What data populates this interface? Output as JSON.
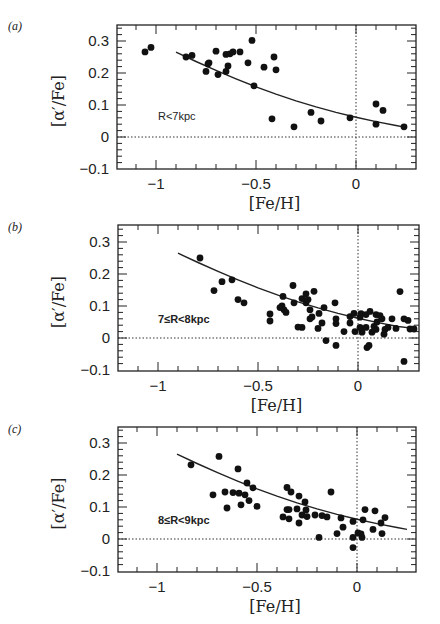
{
  "chart_data": [
    {
      "type": "scatter",
      "panel_label": "(a)",
      "annotation": "R<7kpc",
      "xlabel": "[Fe/H]",
      "ylabel": "[α′/Fe]",
      "xlim": [
        -1.2,
        0.3
      ],
      "ylim": [
        -0.1,
        0.35
      ],
      "xticks": [
        -1,
        -0.5,
        0
      ],
      "xtick_labels": [
        "−1",
        "−0.5",
        "0"
      ],
      "yticks": [
        -0.1,
        0,
        0.1,
        0.2,
        0.3
      ],
      "ytick_labels": [
        "−0.1",
        "0",
        "0.1",
        "0.2",
        "0.3"
      ],
      "reference_lines": {
        "horizontal": 0,
        "vertical": 0
      },
      "grid": false,
      "legend": null,
      "series": [
        {
          "name": "stars",
          "points": [
            [
              -1.055,
              0.266
            ],
            [
              -1.025,
              0.28
            ],
            [
              -0.85,
              0.25
            ],
            [
              -0.82,
              0.255
            ],
            [
              -0.75,
              0.205
            ],
            [
              -0.74,
              0.228
            ],
            [
              -0.735,
              0.232
            ],
            [
              -0.7,
              0.268
            ],
            [
              -0.69,
              0.195
            ],
            [
              -0.65,
              0.205
            ],
            [
              -0.65,
              0.258
            ],
            [
              -0.64,
              0.222
            ],
            [
              -0.63,
              0.26
            ],
            [
              -0.615,
              0.266
            ],
            [
              -0.58,
              0.266
            ],
            [
              -0.54,
              0.232
            ],
            [
              -0.52,
              0.302
            ],
            [
              -0.51,
              0.16
            ],
            [
              -0.46,
              0.218
            ],
            [
              -0.42,
              0.057
            ],
            [
              -0.41,
              0.25
            ],
            [
              -0.4,
              0.21
            ],
            [
              -0.31,
              0.032
            ],
            [
              -0.225,
              0.077
            ],
            [
              -0.175,
              0.05
            ],
            [
              -0.03,
              0.06
            ],
            [
              0.1,
              0.103
            ],
            [
              0.135,
              0.083
            ],
            [
              0.1,
              0.04
            ],
            [
              0.24,
              0.032
            ]
          ]
        },
        {
          "name": "fit",
          "line": [
            [
              -0.9,
              0.265
            ],
            [
              -0.8,
              0.236
            ],
            [
              -0.7,
              0.208
            ],
            [
              -0.6,
              0.182
            ],
            [
              -0.5,
              0.157
            ],
            [
              -0.4,
              0.134
            ],
            [
              -0.3,
              0.113
            ],
            [
              -0.2,
              0.094
            ],
            [
              -0.1,
              0.077
            ],
            [
              0.0,
              0.062
            ],
            [
              0.1,
              0.048
            ],
            [
              0.2,
              0.036
            ],
            [
              0.25,
              0.03
            ]
          ]
        }
      ]
    },
    {
      "type": "scatter",
      "panel_label": "(b)",
      "annotation": "7≤R<8kpc",
      "xlabel": "[Fe/H]",
      "ylabel": "[α′/Fe]",
      "xlim": [
        -1.2,
        0.3
      ],
      "ylim": [
        -0.1,
        0.35
      ],
      "xticks": [
        -1,
        -0.5,
        0
      ],
      "xtick_labels": [
        "−1",
        "−0.5",
        "0"
      ],
      "yticks": [
        -0.1,
        0,
        0.1,
        0.2,
        0.3
      ],
      "ytick_labels": [
        "−0.1",
        "0",
        "0.1",
        "0.2",
        "0.3"
      ],
      "reference_lines": {
        "horizontal": 0,
        "vertical": 0
      },
      "grid": false,
      "legend": null,
      "series": [
        {
          "name": "stars",
          "points": [
            [
              -0.79,
              0.25
            ],
            [
              -0.72,
              0.148
            ],
            [
              -0.68,
              0.176
            ],
            [
              -0.63,
              0.182
            ],
            [
              -0.6,
              0.12
            ],
            [
              -0.57,
              0.11
            ],
            [
              -0.44,
              0.075
            ],
            [
              -0.44,
              0.053
            ],
            [
              -0.39,
              0.095
            ],
            [
              -0.38,
              0.1
            ],
            [
              -0.375,
              0.13
            ],
            [
              -0.37,
              0.088
            ],
            [
              -0.36,
              0.08
            ],
            [
              -0.325,
              0.164
            ],
            [
              -0.32,
              0.11
            ],
            [
              -0.3,
              0.034
            ],
            [
              -0.28,
              0.033
            ],
            [
              -0.28,
              0.123
            ],
            [
              -0.26,
              0.138
            ],
            [
              -0.26,
              0.11
            ],
            [
              -0.25,
              0.12
            ],
            [
              -0.24,
              0.088
            ],
            [
              -0.24,
              0.06
            ],
            [
              -0.23,
              0.066
            ],
            [
              -0.22,
              0.146
            ],
            [
              -0.195,
              0.077
            ],
            [
              -0.2,
              0.03
            ],
            [
              -0.18,
              0.047
            ],
            [
              -0.17,
              0.095
            ],
            [
              -0.16,
              -0.008
            ],
            [
              -0.115,
              0.11
            ],
            [
              -0.11,
              0.06
            ],
            [
              -0.11,
              0.045
            ],
            [
              -0.11,
              -0.023
            ],
            [
              -0.07,
              0.02
            ],
            [
              -0.04,
              0.047
            ],
            [
              -0.04,
              0.067
            ],
            [
              -0.02,
              0.077
            ],
            [
              -0.015,
              0.02
            ],
            [
              0.01,
              0.065
            ],
            [
              0.01,
              0.033
            ],
            [
              0.015,
              0.076
            ],
            [
              0.02,
              0.018
            ],
            [
              0.04,
              0.073
            ],
            [
              0.04,
              0.033
            ],
            [
              0.045,
              -0.03
            ],
            [
              0.055,
              -0.023
            ],
            [
              0.06,
              0.083
            ],
            [
              0.07,
              0.018
            ],
            [
              0.08,
              0.036
            ],
            [
              0.09,
              0.027
            ],
            [
              0.09,
              0.073
            ],
            [
              0.095,
              0.05
            ],
            [
              0.11,
              0.07
            ],
            [
              0.12,
              0.06
            ],
            [
              0.13,
              0.012
            ],
            [
              0.135,
              0.027
            ],
            [
              0.15,
              0.033
            ],
            [
              0.17,
              0.06
            ],
            [
              0.19,
              0.03
            ],
            [
              0.21,
              0.145
            ],
            [
              0.23,
              0.06
            ],
            [
              0.23,
              -0.073
            ],
            [
              0.25,
              0.055
            ],
            [
              0.26,
              0.028
            ],
            [
              0.28,
              0.028
            ]
          ]
        },
        {
          "name": "fit",
          "line": [
            [
              -0.9,
              0.265
            ],
            [
              -0.8,
              0.236
            ],
            [
              -0.7,
              0.208
            ],
            [
              -0.6,
              0.182
            ],
            [
              -0.5,
              0.157
            ],
            [
              -0.4,
              0.134
            ],
            [
              -0.3,
              0.113
            ],
            [
              -0.2,
              0.094
            ],
            [
              -0.1,
              0.077
            ],
            [
              0.0,
              0.062
            ],
            [
              0.1,
              0.048
            ],
            [
              0.2,
              0.036
            ],
            [
              0.28,
              0.03
            ]
          ]
        }
      ]
    },
    {
      "type": "scatter",
      "panel_label": "(c)",
      "annotation": "8≤R<9kpc",
      "xlabel": "[Fe/H]",
      "ylabel": "[α′/Fe]",
      "xlim": [
        -1.2,
        0.3
      ],
      "ylim": [
        -0.1,
        0.35
      ],
      "xticks": [
        -1,
        -0.5,
        0
      ],
      "xtick_labels": [
        "−1",
        "−0.5",
        "0"
      ],
      "yticks": [
        -0.1,
        0,
        0.1,
        0.2,
        0.3
      ],
      "ytick_labels": [
        "−0.1",
        "0",
        "0.1",
        "0.2",
        "0.3"
      ],
      "reference_lines": {
        "horizontal": 0,
        "vertical": 0
      },
      "grid": false,
      "legend": null,
      "series": [
        {
          "name": "stars",
          "points": [
            [
              -0.83,
              0.232
            ],
            [
              -0.72,
              0.138
            ],
            [
              -0.69,
              0.258
            ],
            [
              -0.66,
              0.147
            ],
            [
              -0.65,
              0.097
            ],
            [
              -0.62,
              0.145
            ],
            [
              -0.595,
              0.219
            ],
            [
              -0.59,
              0.143
            ],
            [
              -0.58,
              0.107
            ],
            [
              -0.56,
              0.138
            ],
            [
              -0.55,
              0.175
            ],
            [
              -0.54,
              0.12
            ],
            [
              -0.52,
              0.16
            ],
            [
              -0.5,
              0.102
            ],
            [
              -0.37,
              0.069
            ],
            [
              -0.35,
              0.161
            ],
            [
              -0.35,
              0.092
            ],
            [
              -0.34,
              0.092
            ],
            [
              -0.34,
              0.063
            ],
            [
              -0.33,
              0.147
            ],
            [
              -0.3,
              0.094
            ],
            [
              -0.29,
              0.134
            ],
            [
              -0.29,
              0.05
            ],
            [
              -0.275,
              0.075
            ],
            [
              -0.26,
              0.116
            ],
            [
              -0.255,
              0.091
            ],
            [
              -0.25,
              0.07
            ],
            [
              -0.21,
              0.075
            ],
            [
              -0.19,
              0.005
            ],
            [
              -0.175,
              0.073
            ],
            [
              -0.15,
              0.069
            ],
            [
              -0.13,
              0.147
            ],
            [
              -0.1,
              0.017
            ],
            [
              -0.08,
              0.066
            ],
            [
              -0.07,
              0.037
            ],
            [
              -0.02,
              0.055
            ],
            [
              -0.02,
              0.005
            ],
            [
              -0.02,
              -0.027
            ],
            [
              0.005,
              0.019
            ],
            [
              0.02,
              0.016
            ],
            [
              0.025,
              0.005
            ],
            [
              0.03,
              0.06
            ],
            [
              0.04,
              0.092
            ],
            [
              0.08,
              0.03
            ],
            [
              0.09,
              0.088
            ],
            [
              0.12,
              0.05
            ],
            [
              0.125,
              0.017
            ],
            [
              0.14,
              0.067
            ]
          ]
        },
        {
          "name": "fit",
          "line": [
            [
              -0.9,
              0.265
            ],
            [
              -0.8,
              0.236
            ],
            [
              -0.7,
              0.208
            ],
            [
              -0.6,
              0.182
            ],
            [
              -0.5,
              0.157
            ],
            [
              -0.4,
              0.134
            ],
            [
              -0.3,
              0.113
            ],
            [
              -0.2,
              0.094
            ],
            [
              -0.1,
              0.077
            ],
            [
              0.0,
              0.062
            ],
            [
              0.1,
              0.048
            ],
            [
              0.2,
              0.036
            ],
            [
              0.25,
              0.03
            ]
          ]
        }
      ]
    }
  ],
  "layout": {
    "panels": [
      {
        "frame": [
          117,
          25,
          416,
          169
        ],
        "x0px": 356,
        "y0px": 137,
        "label_pos": [
          8,
          30
        ],
        "annot_pos": [
          158,
          120
        ],
        "annot_bold": false
      },
      {
        "frame": [
          118,
          225,
          419,
          371
        ],
        "x0px": 358,
        "y0px": 338,
        "label_pos": [
          8,
          231
        ],
        "annot_pos": [
          158,
          323
        ],
        "annot_bold": true
      },
      {
        "frame": [
          118,
          427,
          416,
          572
        ],
        "x0px": 357,
        "y0px": 539,
        "label_pos": [
          8,
          433
        ],
        "annot_pos": [
          158,
          524
        ],
        "annot_bold": true
      }
    ],
    "px_per_x": 200,
    "px_per_y": 320
  }
}
